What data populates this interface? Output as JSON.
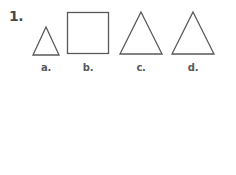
{
  "worksheet": {
    "background_color": "#ffffff",
    "outline_color": "#58595b",
    "label_color": "#55585c",
    "questions": [
      {
        "number": "1.",
        "choices": [
          {
            "letter": "a.",
            "icon": "small-triangle-icon",
            "shape": "triangle",
            "size": "small"
          },
          {
            "letter": "b.",
            "icon": "square-icon",
            "shape": "square",
            "size": "large"
          },
          {
            "letter": "c.",
            "icon": "large-triangle-icon",
            "shape": "triangle",
            "size": "large"
          },
          {
            "letter": "d.",
            "icon": "large-triangle-icon",
            "shape": "triangle",
            "size": "large"
          }
        ]
      },
      {
        "number": "3.",
        "choices": [
          {
            "letter": "a.",
            "icon": "baseball-icon",
            "object": "baseball",
            "color": "#d9d9d9"
          },
          {
            "letter": "b.",
            "icon": "football-icon",
            "object": "football",
            "color": "#3b3b3b"
          },
          {
            "letter": "c.",
            "icon": "cookie-icon",
            "object": "chocolate chip cookie",
            "color": "#8c8c8c"
          },
          {
            "letter": "d.",
            "icon": "horseshoe-icon",
            "object": "horseshoe",
            "color": "#9a9a9a"
          }
        ]
      }
    ]
  }
}
